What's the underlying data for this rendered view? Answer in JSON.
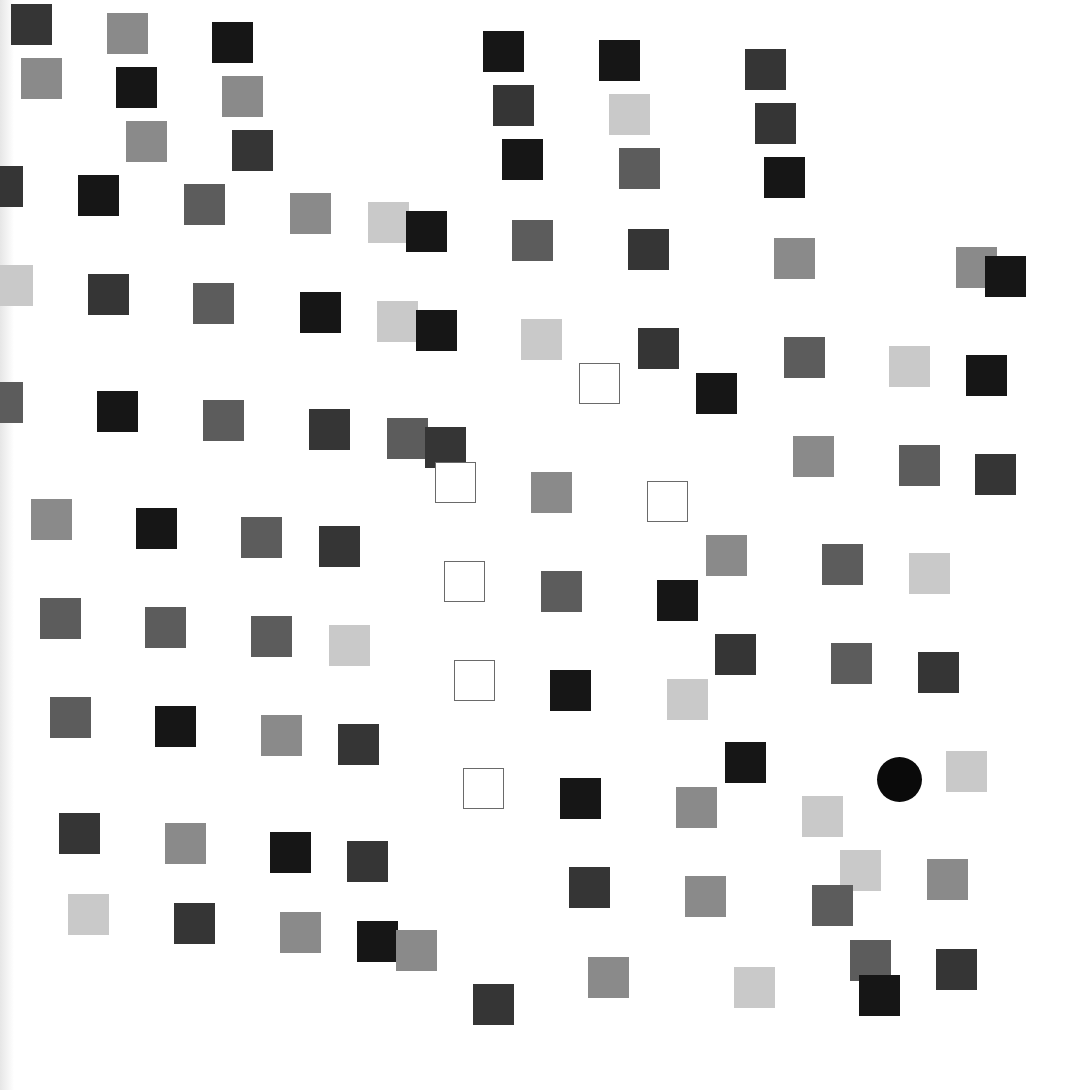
{
  "shades": {
    "black": "#161616",
    "dark": "#353535",
    "mid": "#5c5c5c",
    "gray": "#8a8a8a",
    "light": "#c9c9c9",
    "outline": "#6a6a6a"
  },
  "target": {
    "shape": "circle",
    "x": 877,
    "y": 757,
    "size": 45,
    "color": "#0a0a0a"
  },
  "squares": [
    {
      "x": 11,
      "y": 4,
      "s": "dark"
    },
    {
      "x": 107,
      "y": 13,
      "s": "gray"
    },
    {
      "x": 212,
      "y": 22,
      "s": "black"
    },
    {
      "x": 21,
      "y": 58,
      "s": "gray"
    },
    {
      "x": 116,
      "y": 67,
      "s": "black"
    },
    {
      "x": 222,
      "y": 76,
      "s": "gray"
    },
    {
      "x": 126,
      "y": 121,
      "s": "gray"
    },
    {
      "x": 232,
      "y": 130,
      "s": "dark"
    },
    {
      "x": -18,
      "y": 166,
      "s": "dark"
    },
    {
      "x": 78,
      "y": 175,
      "s": "black"
    },
    {
      "x": 184,
      "y": 184,
      "s": "mid"
    },
    {
      "x": 290,
      "y": 193,
      "s": "gray"
    },
    {
      "x": 368,
      "y": 202,
      "s": "light"
    },
    {
      "x": 406,
      "y": 211,
      "s": "black"
    },
    {
      "x": 483,
      "y": 31,
      "s": "black"
    },
    {
      "x": 599,
      "y": 40,
      "s": "black"
    },
    {
      "x": 493,
      "y": 85,
      "s": "dark"
    },
    {
      "x": 609,
      "y": 94,
      "s": "light"
    },
    {
      "x": 502,
      "y": 139,
      "s": "black"
    },
    {
      "x": 619,
      "y": 148,
      "s": "mid"
    },
    {
      "x": 512,
      "y": 220,
      "s": "mid"
    },
    {
      "x": 628,
      "y": 229,
      "s": "dark"
    },
    {
      "x": 745,
      "y": 49,
      "s": "dark"
    },
    {
      "x": 755,
      "y": 103,
      "s": "dark"
    },
    {
      "x": 764,
      "y": 157,
      "s": "black"
    },
    {
      "x": 774,
      "y": 238,
      "s": "gray"
    },
    {
      "x": 956,
      "y": 247,
      "s": "gray"
    },
    {
      "x": 985,
      "y": 256,
      "s": "black"
    },
    {
      "x": -8,
      "y": 265,
      "s": "light"
    },
    {
      "x": 88,
      "y": 274,
      "s": "dark"
    },
    {
      "x": 193,
      "y": 283,
      "s": "mid"
    },
    {
      "x": 300,
      "y": 292,
      "s": "black"
    },
    {
      "x": 377,
      "y": 301,
      "s": "light"
    },
    {
      "x": 416,
      "y": 310,
      "s": "black"
    },
    {
      "x": 521,
      "y": 319,
      "s": "light"
    },
    {
      "x": 638,
      "y": 328,
      "s": "dark"
    },
    {
      "x": 696,
      "y": 373,
      "s": "black"
    },
    {
      "x": 784,
      "y": 337,
      "s": "mid"
    },
    {
      "x": 889,
      "y": 346,
      "s": "light"
    },
    {
      "x": 966,
      "y": 355,
      "s": "black"
    },
    {
      "x": -18,
      "y": 382,
      "s": "mid"
    },
    {
      "x": 97,
      "y": 391,
      "s": "black"
    },
    {
      "x": 203,
      "y": 400,
      "s": "mid"
    },
    {
      "x": 309,
      "y": 409,
      "s": "dark"
    },
    {
      "x": 387,
      "y": 418,
      "s": "mid"
    },
    {
      "x": 425,
      "y": 427,
      "s": "dark"
    },
    {
      "x": 793,
      "y": 436,
      "s": "gray"
    },
    {
      "x": 899,
      "y": 445,
      "s": "mid"
    },
    {
      "x": 975,
      "y": 454,
      "s": "dark"
    },
    {
      "x": 31,
      "y": 499,
      "s": "gray"
    },
    {
      "x": 136,
      "y": 508,
      "s": "black"
    },
    {
      "x": 241,
      "y": 517,
      "s": "mid"
    },
    {
      "x": 319,
      "y": 526,
      "s": "dark"
    },
    {
      "x": 531,
      "y": 472,
      "s": "gray"
    },
    {
      "x": 706,
      "y": 535,
      "s": "gray"
    },
    {
      "x": 822,
      "y": 544,
      "s": "mid"
    },
    {
      "x": 909,
      "y": 553,
      "s": "light"
    },
    {
      "x": 40,
      "y": 598,
      "s": "mid"
    },
    {
      "x": 145,
      "y": 607,
      "s": "mid"
    },
    {
      "x": 251,
      "y": 616,
      "s": "mid"
    },
    {
      "x": 329,
      "y": 625,
      "s": "light"
    },
    {
      "x": 541,
      "y": 571,
      "s": "mid"
    },
    {
      "x": 657,
      "y": 580,
      "s": "black"
    },
    {
      "x": 715,
      "y": 634,
      "s": "dark"
    },
    {
      "x": 831,
      "y": 643,
      "s": "mid"
    },
    {
      "x": 918,
      "y": 652,
      "s": "dark"
    },
    {
      "x": 50,
      "y": 697,
      "s": "mid"
    },
    {
      "x": 155,
      "y": 706,
      "s": "black"
    },
    {
      "x": 261,
      "y": 715,
      "s": "gray"
    },
    {
      "x": 338,
      "y": 724,
      "s": "dark"
    },
    {
      "x": 550,
      "y": 670,
      "s": "black"
    },
    {
      "x": 667,
      "y": 679,
      "s": "light"
    },
    {
      "x": 725,
      "y": 742,
      "s": "black"
    },
    {
      "x": 946,
      "y": 751,
      "s": "light"
    },
    {
      "x": 59,
      "y": 813,
      "s": "dark"
    },
    {
      "x": 165,
      "y": 823,
      "s": "gray"
    },
    {
      "x": 270,
      "y": 832,
      "s": "black"
    },
    {
      "x": 347,
      "y": 841,
      "s": "dark"
    },
    {
      "x": 560,
      "y": 778,
      "s": "black"
    },
    {
      "x": 676,
      "y": 787,
      "s": "gray"
    },
    {
      "x": 802,
      "y": 796,
      "s": "light"
    },
    {
      "x": 68,
      "y": 894,
      "s": "light"
    },
    {
      "x": 174,
      "y": 903,
      "s": "dark"
    },
    {
      "x": 280,
      "y": 912,
      "s": "gray"
    },
    {
      "x": 357,
      "y": 921,
      "s": "black"
    },
    {
      "x": 396,
      "y": 930,
      "s": "gray"
    },
    {
      "x": 569,
      "y": 867,
      "s": "dark"
    },
    {
      "x": 685,
      "y": 876,
      "s": "gray"
    },
    {
      "x": 840,
      "y": 850,
      "s": "light"
    },
    {
      "x": 812,
      "y": 885,
      "s": "mid"
    },
    {
      "x": 927,
      "y": 859,
      "s": "gray"
    },
    {
      "x": 473,
      "y": 984,
      "s": "dark"
    },
    {
      "x": 588,
      "y": 957,
      "s": "gray"
    },
    {
      "x": 734,
      "y": 967,
      "s": "light"
    },
    {
      "x": 850,
      "y": 940,
      "s": "mid"
    },
    {
      "x": 859,
      "y": 975,
      "s": "black"
    },
    {
      "x": 936,
      "y": 949,
      "s": "dark"
    },
    {
      "x": 579,
      "y": 363,
      "s": "outline"
    },
    {
      "x": 435,
      "y": 462,
      "s": "outline"
    },
    {
      "x": 647,
      "y": 481,
      "s": "outline"
    },
    {
      "x": 444,
      "y": 561,
      "s": "outline"
    },
    {
      "x": 454,
      "y": 660,
      "s": "outline"
    },
    {
      "x": 463,
      "y": 768,
      "s": "outline"
    }
  ]
}
